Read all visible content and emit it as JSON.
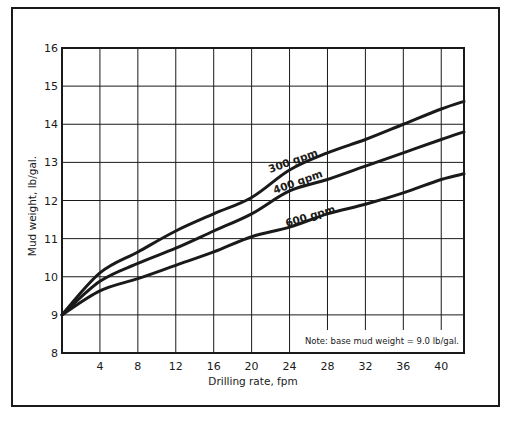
{
  "chart_data": {
    "type": "line",
    "title": "",
    "xlabel": "Drilling rate, fpm",
    "ylabel": "Mud weight, lb/gal.",
    "xlim": [
      0,
      42.4
    ],
    "ylim": [
      8,
      16
    ],
    "grid": true,
    "x_ticks": [
      4,
      8,
      12,
      16,
      20,
      24,
      28,
      32,
      36,
      40
    ],
    "y_ticks": [
      8,
      9,
      10,
      11,
      12,
      13,
      14,
      15,
      16
    ],
    "x": [
      0,
      4,
      8,
      12,
      16,
      20,
      24,
      28,
      32,
      36,
      40,
      42.4
    ],
    "series": [
      {
        "name": "300 gpm",
        "values": [
          9.0,
          10.1,
          10.65,
          11.2,
          11.65,
          12.08,
          12.8,
          13.25,
          13.6,
          14.0,
          14.4,
          14.6
        ]
      },
      {
        "name": "400 gpm",
        "values": [
          9.0,
          9.88,
          10.35,
          10.75,
          11.2,
          11.65,
          12.25,
          12.55,
          12.9,
          13.25,
          13.6,
          13.8
        ]
      },
      {
        "name": "600 gpm",
        "values": [
          9.0,
          9.63,
          9.95,
          10.3,
          10.65,
          11.05,
          11.3,
          11.65,
          11.9,
          12.2,
          12.55,
          12.7
        ]
      }
    ],
    "curve_labels": [
      {
        "text": "300 gpm",
        "x": 24.5,
        "y": 12.95,
        "angle": -20
      },
      {
        "text": "400 gpm",
        "x": 25.0,
        "y": 12.4,
        "angle": -20
      },
      {
        "text": "600 gpm",
        "x": 26.3,
        "y": 11.5,
        "angle": -17
      }
    ],
    "annotations": [
      {
        "text": "Note:  base mud weight = 9.0 lb/gal.",
        "position": "bottom-right inside plot"
      }
    ],
    "legend": "none (inline curve labels)"
  },
  "colors": {
    "ink": "#1a1a1a",
    "background": "#ffffff"
  }
}
